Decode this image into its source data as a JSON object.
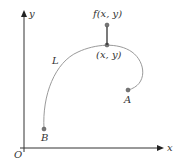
{
  "diagram": {
    "axes": {
      "x_label": "x",
      "y_label": "y",
      "origin_label": "O"
    },
    "curve": {
      "name": "L",
      "start_label": "B",
      "end_label": "A"
    },
    "point": {
      "label": "(x, y)"
    },
    "function_value": {
      "label": "f(x, y)"
    },
    "colors": {
      "axis": "#333333",
      "curve": "#999999",
      "point": "#666666",
      "text": "#333333"
    }
  }
}
